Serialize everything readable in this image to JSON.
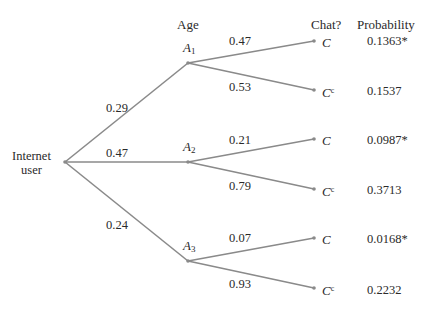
{
  "headers": {
    "age": "Age",
    "chat": "Chat?",
    "probability": "Probability"
  },
  "root": {
    "line1": "Internet",
    "line2": "user"
  },
  "colors": {
    "branch": "#8a8a8a",
    "text": "#2a2a2a",
    "background": "#ffffff"
  },
  "age_groups": [
    {
      "name": "A",
      "sub": "1",
      "prob": "0.29",
      "branches": [
        {
          "outcome": "C",
          "sup": "",
          "prob": "0.47",
          "joint": "0.1363*"
        },
        {
          "outcome": "C",
          "sup": "c",
          "prob": "0.53",
          "joint": "0.1537"
        }
      ]
    },
    {
      "name": "A",
      "sub": "2",
      "prob": "0.47",
      "branches": [
        {
          "outcome": "C",
          "sup": "",
          "prob": "0.21",
          "joint": "0.0987*"
        },
        {
          "outcome": "C",
          "sup": "c",
          "prob": "0.79",
          "joint": "0.3713"
        }
      ]
    },
    {
      "name": "A",
      "sub": "3",
      "prob": "0.24",
      "branches": [
        {
          "outcome": "C",
          "sup": "",
          "prob": "0.07",
          "joint": "0.0168*"
        },
        {
          "outcome": "C",
          "sup": "c",
          "prob": "0.93",
          "joint": "0.2232"
        }
      ]
    }
  ]
}
